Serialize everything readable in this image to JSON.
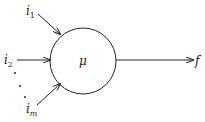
{
  "diagram": {
    "type": "neuron-model",
    "node": {
      "label": "μ"
    },
    "inputs": [
      {
        "label": "i",
        "sub": "1"
      },
      {
        "label": "i",
        "sub": "2"
      },
      {
        "label": "i",
        "sub": "m"
      }
    ],
    "ellipsis": "⋮",
    "output": {
      "label": "f"
    },
    "colors": {
      "stroke": "#222222",
      "background": "#ffffff"
    }
  }
}
